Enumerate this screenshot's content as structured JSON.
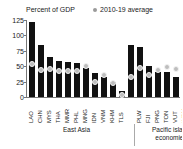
{
  "chart_data": {
    "type": "bar",
    "title": "Percent of GDP",
    "ylabel": "Percent of GDP",
    "xlabel": "",
    "ylim": [
      0,
      125
    ],
    "yticks": [
      0,
      25,
      50,
      75,
      100,
      125
    ],
    "ytick_labels": [
      "0",
      "25",
      "50",
      "75",
      "100",
      "125"
    ],
    "grid": false,
    "legend_position": "top-right",
    "legend": [
      {
        "name": "2010-19 average",
        "marker": "dot",
        "color": "#bdbdbd"
      }
    ],
    "series": [
      {
        "name": "Current",
        "type": "bar",
        "color": "#111111"
      },
      {
        "name": "2010-19 average",
        "type": "scatter",
        "color": "#bdbdbd"
      }
    ],
    "groups": [
      {
        "name": "East Asia",
        "categories": [
          "LAO",
          "CHN",
          "MYS",
          "THA",
          "MMR",
          "PHL",
          "MNG",
          "IDN",
          "VNM",
          "KHM",
          "TLS"
        ],
        "values": [
          122,
          84,
          65,
          58,
          57,
          55,
          47,
          39,
          33,
          25,
          9
        ],
        "averages": [
          53,
          44,
          45,
          42,
          42,
          42,
          51,
          25,
          35,
          23,
          3
        ]
      },
      {
        "name": "Pacific island economies",
        "categories": [
          "PLW",
          "FJI",
          "PNG",
          "TON",
          "VUT",
          "WSM",
          "SLB",
          "FSM"
        ],
        "values": [
          84,
          82,
          51,
          40,
          40,
          32,
          22,
          11
        ],
        "averages": [
          32,
          47,
          36,
          44,
          49,
          46,
          23,
          30
        ]
      }
    ]
  },
  "axis": {
    "title": "Percent of GDP",
    "ytick_labels": [
      "125",
      "100",
      "75",
      "50",
      "25",
      "0"
    ]
  },
  "legend": {
    "average_label": "2010-19 average"
  },
  "captions": {
    "east_asia": "East Asia",
    "pacific": "Pacific island\neconomies"
  }
}
